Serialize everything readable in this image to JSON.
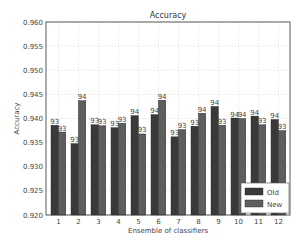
{
  "chart_data": {
    "type": "bar",
    "title": "Accuracy",
    "xlabel": "Ensemble of classifiers",
    "ylabel": "Accuracy",
    "ylim": [
      0.92,
      0.96
    ],
    "yticks": [
      "0.920",
      "0.925",
      "0.930",
      "0.935",
      "0.940",
      "0.945",
      "0.950",
      "0.955",
      "0.960"
    ],
    "grid": true,
    "legend_position": "lower right",
    "categories": [
      "1",
      "2",
      "3",
      "4",
      "5",
      "6",
      "7",
      "8",
      "9",
      "10",
      "11",
      "12"
    ],
    "series": [
      {
        "name": "Old",
        "color": "#3a3a3a",
        "values": [
          0.9386,
          0.9348,
          0.9387,
          0.9381,
          0.9406,
          0.9408,
          0.9362,
          0.9384,
          0.9425,
          0.9401,
          0.9405,
          0.9398
        ],
        "labels": [
          "93",
          "93",
          "93",
          "93",
          "94",
          "94",
          "93",
          "93",
          "94",
          "94",
          "94",
          "94"
        ]
      },
      {
        "name": "New",
        "color": "#5e5e5e",
        "values": [
          0.9372,
          0.9437,
          0.9385,
          0.939,
          0.9368,
          0.9438,
          0.9377,
          0.9411,
          0.9386,
          0.94,
          0.9387,
          0.9375
        ],
        "labels": [
          "93",
          "94",
          "93",
          "93",
          "93",
          "94",
          "93",
          "94",
          "93",
          "94",
          "93",
          "93"
        ]
      }
    ]
  }
}
